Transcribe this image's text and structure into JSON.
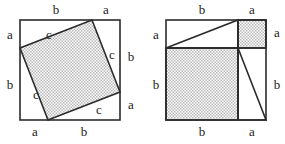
{
  "diagram": {
    "type": "geometric-proof",
    "stroke_color": "#2b2b2b",
    "shade_color": "#c9c9c9",
    "background_color": "#ffffff",
    "legs": {
      "a": "a",
      "b": "b",
      "hypotenuse": "c"
    },
    "geometry": {
      "side_a_px": 28,
      "side_b_px": 72,
      "outer_square_px": 100
    }
  },
  "left_figure": {
    "name": "tilted-square-arrangement",
    "outer_square": {
      "x": 20,
      "y": 20,
      "size": 100
    },
    "inner_square_vertices": [
      {
        "x": 92,
        "y": 20
      },
      {
        "x": 120,
        "y": 92
      },
      {
        "x": 48,
        "y": 120
      },
      {
        "x": 20,
        "y": 48
      }
    ],
    "labels": [
      {
        "text": "b",
        "x": 56,
        "y": 11,
        "side": "top-left",
        "name": "label-top-b"
      },
      {
        "text": "a",
        "x": 106,
        "y": 11,
        "side": "top-right",
        "name": "label-top-a"
      },
      {
        "text": "a",
        "x": 10,
        "y": 36,
        "side": "left-top",
        "name": "label-left-a"
      },
      {
        "text": "b",
        "x": 10,
        "y": 86,
        "side": "left-bottom",
        "name": "label-left-b"
      },
      {
        "text": "b",
        "x": 131,
        "y": 58,
        "side": "right-top",
        "name": "label-right-b"
      },
      {
        "text": "a",
        "x": 131,
        "y": 106,
        "side": "right-bottom",
        "name": "label-right-a"
      },
      {
        "text": "a",
        "x": 35,
        "y": 133,
        "side": "bottom-left",
        "name": "label-bottom-a"
      },
      {
        "text": "b",
        "x": 84,
        "y": 133,
        "side": "bottom-right",
        "name": "label-bottom-b"
      },
      {
        "text": "c",
        "x": 49,
        "y": 36,
        "side": "inner-upper-left",
        "name": "label-c-upper-left"
      },
      {
        "text": "c",
        "x": 112,
        "y": 56,
        "side": "inner-right",
        "name": "label-c-right"
      },
      {
        "text": "c",
        "x": 36,
        "y": 96,
        "side": "inner-lower-left",
        "name": "label-c-lower-left"
      },
      {
        "text": "c",
        "x": 99,
        "y": 111,
        "side": "inner-bottom",
        "name": "label-c-bottom"
      }
    ]
  },
  "right_figure": {
    "name": "two-squares-arrangement",
    "outer_square": {
      "x": 166,
      "y": 20,
      "size": 100
    },
    "square_b": {
      "x": 166,
      "y": 48,
      "size": 72
    },
    "square_a": {
      "x": 238,
      "y": 20,
      "size": 28
    },
    "triangle_top": [
      {
        "x": 166,
        "y": 48
      },
      {
        "x": 238,
        "y": 20
      },
      {
        "x": 238,
        "y": 48
      }
    ],
    "triangle_right": [
      {
        "x": 238,
        "y": 48
      },
      {
        "x": 266,
        "y": 120
      },
      {
        "x": 238,
        "y": 120
      }
    ],
    "labels": [
      {
        "text": "b",
        "x": 202,
        "y": 11,
        "side": "top-left",
        "name": "label-top-b"
      },
      {
        "text": "a",
        "x": 252,
        "y": 11,
        "side": "top-right",
        "name": "label-top-a"
      },
      {
        "text": "a",
        "x": 156,
        "y": 36,
        "side": "left-top",
        "name": "label-left-a"
      },
      {
        "text": "b",
        "x": 156,
        "y": 86,
        "side": "left-bottom",
        "name": "label-left-b"
      },
      {
        "text": "a",
        "x": 277,
        "y": 34,
        "side": "right-top",
        "name": "label-right-a"
      },
      {
        "text": "b",
        "x": 277,
        "y": 86,
        "side": "right-bottom",
        "name": "label-right-b"
      },
      {
        "text": "b",
        "x": 202,
        "y": 133,
        "side": "bottom-left",
        "name": "label-bottom-b"
      },
      {
        "text": "a",
        "x": 252,
        "y": 133,
        "side": "bottom-right",
        "name": "label-bottom-a"
      }
    ]
  }
}
